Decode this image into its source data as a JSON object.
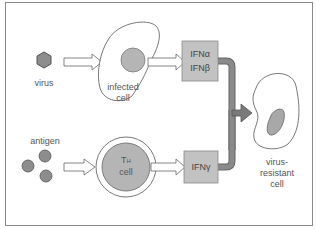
{
  "labels": {
    "virus": "virus",
    "infected_cell": "infected\ncell",
    "ifn_ab": "IFNα\nIFNβ",
    "antigen": "antigen",
    "th_cell_t": "T",
    "th_cell_h": "H",
    "th_cell_cell": "cell",
    "ifn_g": "IFNγ",
    "resistant_cell": "virus-\nresistant\ncell"
  },
  "colors": {
    "fill_gray": "#b5b5b5",
    "box_gray": "#c2c2c2",
    "thick_arrow": "#7a7a7a",
    "outline": "#666666"
  }
}
